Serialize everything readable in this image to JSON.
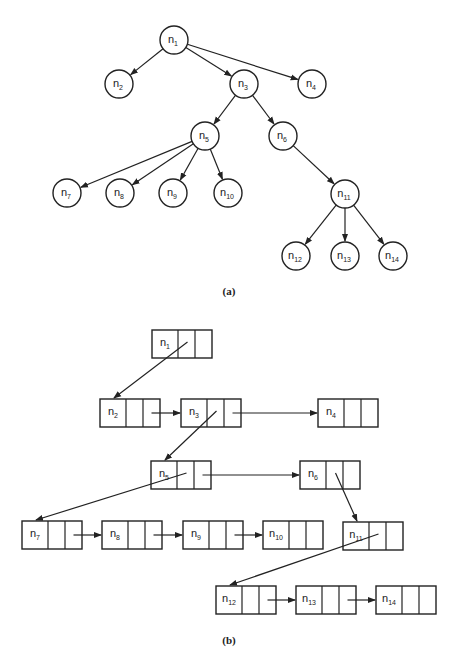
{
  "figure_a": {
    "caption": "(a)",
    "nodes": [
      {
        "id": "n1",
        "base": "n",
        "sub": "1",
        "x": 174,
        "y": 40
      },
      {
        "id": "n2",
        "base": "n",
        "sub": "2",
        "x": 119,
        "y": 84
      },
      {
        "id": "n3",
        "base": "n",
        "sub": "3",
        "x": 244,
        "y": 84
      },
      {
        "id": "n4",
        "base": "n",
        "sub": "4",
        "x": 312,
        "y": 84
      },
      {
        "id": "n5",
        "base": "n",
        "sub": "5",
        "x": 205,
        "y": 136
      },
      {
        "id": "n6",
        "base": "n",
        "sub": "6",
        "x": 283,
        "y": 136
      },
      {
        "id": "n7",
        "base": "n",
        "sub": "7",
        "x": 67,
        "y": 193
      },
      {
        "id": "n8",
        "base": "n",
        "sub": "8",
        "x": 120,
        "y": 193
      },
      {
        "id": "n9",
        "base": "n",
        "sub": "9",
        "x": 173,
        "y": 193
      },
      {
        "id": "n10",
        "base": "n",
        "sub": "10",
        "x": 228,
        "y": 193
      },
      {
        "id": "n11",
        "base": "n",
        "sub": "11",
        "x": 345,
        "y": 194
      },
      {
        "id": "n12",
        "base": "n",
        "sub": "12",
        "x": 296,
        "y": 256
      },
      {
        "id": "n13",
        "base": "n",
        "sub": "13",
        "x": 345,
        "y": 256
      },
      {
        "id": "n14",
        "base": "n",
        "sub": "14",
        "x": 393,
        "y": 256
      }
    ],
    "edges": [
      [
        "n1",
        "n2"
      ],
      [
        "n1",
        "n3"
      ],
      [
        "n1",
        "n4"
      ],
      [
        "n3",
        "n5"
      ],
      [
        "n3",
        "n6"
      ],
      [
        "n5",
        "n7"
      ],
      [
        "n5",
        "n8"
      ],
      [
        "n5",
        "n9"
      ],
      [
        "n5",
        "n10"
      ],
      [
        "n6",
        "n11"
      ],
      [
        "n11",
        "n12"
      ],
      [
        "n11",
        "n13"
      ],
      [
        "n11",
        "n14"
      ]
    ]
  },
  "figure_b": {
    "caption": "(b)",
    "boxes": [
      {
        "id": "n1",
        "base": "n",
        "sub": "1",
        "x": 152,
        "y": 330
      },
      {
        "id": "n2",
        "base": "n",
        "sub": "2",
        "x": 100,
        "y": 399
      },
      {
        "id": "n3",
        "base": "n",
        "sub": "3",
        "x": 181,
        "y": 399
      },
      {
        "id": "n4",
        "base": "n",
        "sub": "4",
        "x": 318,
        "y": 399
      },
      {
        "id": "n5",
        "base": "n",
        "sub": "5",
        "x": 151,
        "y": 461
      },
      {
        "id": "n6",
        "base": "n",
        "sub": "6",
        "x": 300,
        "y": 461
      },
      {
        "id": "n7",
        "base": "n",
        "sub": "7",
        "x": 22,
        "y": 521
      },
      {
        "id": "n8",
        "base": "n",
        "sub": "8",
        "x": 102,
        "y": 521
      },
      {
        "id": "n9",
        "base": "n",
        "sub": "9",
        "x": 183,
        "y": 521
      },
      {
        "id": "n10",
        "base": "n",
        "sub": "10",
        "x": 263,
        "y": 521
      },
      {
        "id": "n11",
        "base": "n",
        "sub": "11",
        "x": 343,
        "y": 522
      },
      {
        "id": "n12",
        "base": "n",
        "sub": "12",
        "x": 216,
        "y": 586
      },
      {
        "id": "n13",
        "base": "n",
        "sub": "13",
        "x": 296,
        "y": 586
      },
      {
        "id": "n14",
        "base": "n",
        "sub": "14",
        "x": 376,
        "y": 586
      }
    ],
    "child_links": [
      [
        "n1",
        "n2"
      ],
      [
        "n3",
        "n5"
      ],
      [
        "n5",
        "n7"
      ],
      [
        "n6",
        "n11"
      ],
      [
        "n11",
        "n12"
      ]
    ],
    "sibling_links": [
      [
        "n2",
        "n3"
      ],
      [
        "n3",
        "n4"
      ],
      [
        "n5",
        "n6"
      ],
      [
        "n7",
        "n8"
      ],
      [
        "n8",
        "n9"
      ],
      [
        "n9",
        "n10"
      ],
      [
        "n12",
        "n13"
      ],
      [
        "n13",
        "n14"
      ]
    ]
  }
}
